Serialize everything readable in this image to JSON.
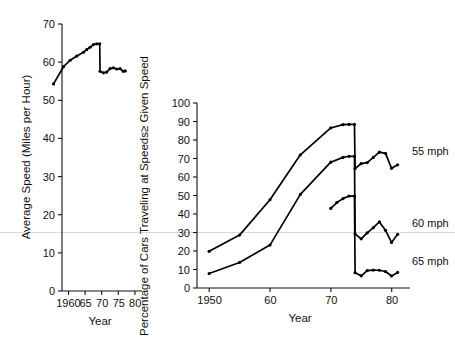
{
  "figure": {
    "background_color": "#ffffff",
    "ink_color": "#000000",
    "artifact_color": "#d8d8d8"
  },
  "chart_data": [
    {
      "id": "left-panel",
      "type": "line",
      "title": "",
      "xlabel": "Year",
      "ylabel": "Average Speed (Miles per Hour)",
      "xlim": [
        1958,
        1982.5
      ],
      "ylim": [
        0,
        70
      ],
      "grid": false,
      "legend": "none",
      "xticks": [
        1960,
        1965,
        1970,
        1975,
        1980
      ],
      "xticklabels": [
        "1960",
        "65",
        "70",
        "75",
        "80"
      ],
      "yticks": [
        0,
        10,
        20,
        30,
        40,
        50,
        60,
        70
      ],
      "yticklabels": [
        "0",
        "10",
        "20",
        "30",
        "40",
        "50",
        "60",
        "70"
      ],
      "series": [
        {
          "name": "Average speed",
          "x": [
            1960,
            1963,
            1965,
            1967,
            1969,
            1970,
            1971,
            1972,
            1973,
            1973.9,
            1974,
            1975,
            1976,
            1977,
            1978,
            1979,
            1980,
            1981,
            1981.6
          ],
          "values": [
            54.3,
            58.8,
            60.5,
            61.6,
            62.6,
            63.3,
            63.9,
            64.6,
            64.8,
            64.8,
            57.6,
            57.2,
            57.4,
            58.3,
            58.5,
            58.2,
            58.3,
            57.6,
            57.7
          ]
        }
      ]
    },
    {
      "id": "right-panel",
      "type": "line",
      "title": "",
      "xlabel": "Year",
      "ylabel": "Percentage of Cars Traveling at Speeds≥ Given Speed",
      "xlim": [
        1948,
        1983
      ],
      "ylim": [
        0,
        100
      ],
      "grid": false,
      "legend": "right-inline",
      "xticks": [
        1950,
        1960,
        1970,
        1980
      ],
      "xticklabels": [
        "1950",
        "60",
        "70",
        "80"
      ],
      "yticks": [
        0,
        10,
        20,
        30,
        40,
        50,
        60,
        70,
        80,
        90,
        100
      ],
      "yticklabels": [
        "0",
        "10",
        "20",
        "30",
        "40",
        "50",
        "60",
        "70",
        "80",
        "90",
        "100"
      ],
      "series": [
        {
          "name": "55 mph",
          "label": "55 mph",
          "x": [
            1950,
            1955,
            1960,
            1965,
            1970,
            1972,
            1973,
            1973.9,
            1974,
            1975,
            1976,
            1977,
            1978,
            1979,
            1980,
            1981
          ],
          "values": [
            19.8,
            28.6,
            47.7,
            72.0,
            86.5,
            88.3,
            88.4,
            88.4,
            64.6,
            67.2,
            67.8,
            70.6,
            73.4,
            72.8,
            64.7,
            66.6
          ]
        },
        {
          "name": "60 mph",
          "label": "60 mph",
          "x": [
            1950,
            1955,
            1960,
            1965,
            1970,
            1972,
            1973,
            1973.9,
            1974,
            1975,
            1976,
            1977,
            1978,
            1979,
            1980,
            1981
          ],
          "values": [
            7.8,
            13.8,
            23.2,
            50.6,
            68.0,
            70.6,
            71.2,
            71.2,
            29.3,
            26.6,
            29.8,
            32.6,
            35.7,
            31.2,
            24.6,
            29.0
          ]
        },
        {
          "name": "65 mph",
          "label": "65 mph",
          "x": [
            1970,
            1971,
            1972,
            1973,
            1973.9,
            1974,
            1975,
            1976,
            1977,
            1978,
            1979,
            1980,
            1981
          ],
          "values": [
            43.0,
            46.2,
            48.3,
            49.7,
            49.7,
            8.3,
            6.6,
            9.4,
            9.7,
            9.6,
            8.9,
            6.5,
            8.4
          ]
        }
      ]
    }
  ]
}
